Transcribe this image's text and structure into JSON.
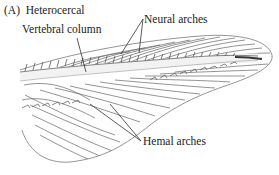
{
  "figure": {
    "panel_label": "(A)",
    "title": "Heterocercal",
    "labels": {
      "vertebral_column": "Vertebral column",
      "neural_arches": "Neural arches",
      "hemal_arches": "Hemal arches"
    },
    "colors": {
      "line": "#555555",
      "fill": "#ffffff",
      "vertebral_band": "#efefef",
      "text": "#222222"
    }
  }
}
